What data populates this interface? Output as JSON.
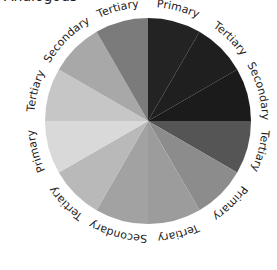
{
  "title_partial": "Analogous",
  "wheel": {
    "cx": 148,
    "cy": 121,
    "r": 103,
    "label_r": 114,
    "segments": [
      {
        "label": "Primary",
        "color": "#232323"
      },
      {
        "label": "Tertiary",
        "color": "#1f1f1f"
      },
      {
        "label": "Secondary",
        "color": "#1b1b1b"
      },
      {
        "label": "Tertiary",
        "color": "#555555"
      },
      {
        "label": "Primary",
        "color": "#8c8c8c"
      },
      {
        "label": "Tertiary",
        "color": "#9c9c9c"
      },
      {
        "label": "Secondary",
        "color": "#a2a2a2"
      },
      {
        "label": "Tertiary",
        "color": "#b9b9b9"
      },
      {
        "label": "Primary",
        "color": "#d9d9d9"
      },
      {
        "label": "Tertiary",
        "color": "#c6c6c6"
      },
      {
        "label": "Secondary",
        "color": "#a8a8a8"
      },
      {
        "label": "Tertiary",
        "color": "#7b7b7b"
      }
    ]
  }
}
